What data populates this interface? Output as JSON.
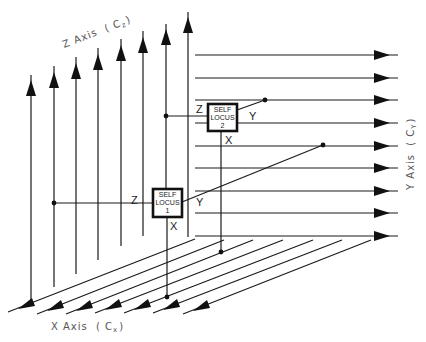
{
  "diagram": {
    "axes": {
      "z": {
        "label": "Z Axis",
        "sub": "( C",
        "subscript": "z",
        "close": ")"
      },
      "y": {
        "label": "Y Axis",
        "sub": "( C",
        "subscript": "Y",
        "close": ")"
      },
      "x": {
        "label": "X Axis",
        "sub": "( C",
        "subscript": "x",
        "close": ")"
      }
    },
    "loci": [
      {
        "line1": "SELF",
        "line2": "LOCUS",
        "line3": "1",
        "z_label": "Z",
        "y_label": "Y",
        "x_label": "X"
      },
      {
        "line1": "SELF",
        "line2": "LOCUS",
        "line3": "2",
        "z_label": "Z",
        "y_label": "Y",
        "x_label": "X"
      }
    ],
    "colors": {
      "line": "#1a1a1a",
      "label": "#555555",
      "background": "#ffffff"
    }
  }
}
